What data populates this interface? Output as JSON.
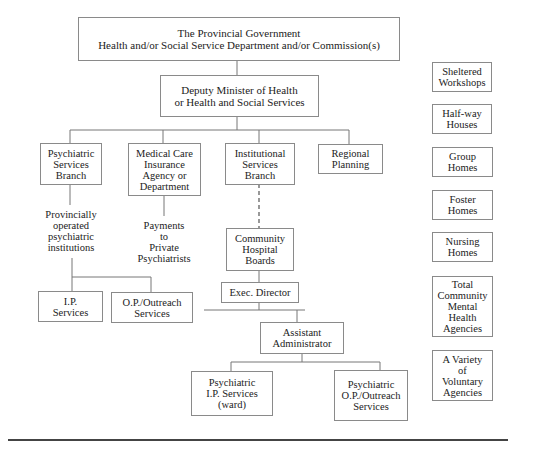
{
  "diagram": {
    "type": "organizational-chart",
    "nodes": {
      "provincial_government": "The Provincial Government\nHealth and/or Social Service Department and/or Commission(s)",
      "deputy_minister": "Deputy Minister of Health\nor Health and Social Services",
      "psychiatric_services_branch": "Psychiatric\nServices\nBranch",
      "medical_care_insurance": "Medical Care\nInsurance\nAgency or\nDepartment",
      "institutional_services_branch": "Institutional\nServices\nBranch",
      "regional_planning": "Regional\nPlanning",
      "provincially_operated": "Provincially\noperated\npsychiatric\ninstitutions",
      "payments_private": "Payments\nto\nPrivate\nPsychiatrists",
      "community_hospital_boards": "Community\nHospital\nBoards",
      "exec_director": "Exec. Director",
      "ip_services": "I.P.\nServices",
      "op_outreach_services": "O.P./Outreach\nServices",
      "assistant_administrator": "Assistant\nAdministrator",
      "psychiatric_ip_ward": "Psychiatric\nI.P. Services\n(ward)",
      "psychiatric_op_outreach": "Psychiatric\nO.P./Outreach\nServices"
    },
    "community_resources": [
      "Sheltered\nWorkshops",
      "Half-way\nHouses",
      "Group\nHomes",
      "Foster\nHomes",
      "Nursing\nHomes",
      "Total\nCommunity\nMental\nHealth\nAgencies",
      "A Variety\nof\nVoluntary\nAgencies"
    ],
    "edges": [
      {
        "from": "provincial_government",
        "to": "deputy_minister",
        "style": "solid"
      },
      {
        "from": "deputy_minister",
        "to": "psychiatric_services_branch",
        "style": "solid"
      },
      {
        "from": "deputy_minister",
        "to": "medical_care_insurance",
        "style": "solid"
      },
      {
        "from": "deputy_minister",
        "to": "institutional_services_branch",
        "style": "solid"
      },
      {
        "from": "deputy_minister",
        "to": "regional_planning",
        "style": "solid"
      },
      {
        "from": "psychiatric_services_branch",
        "to": "provincially_operated",
        "style": "solid"
      },
      {
        "from": "medical_care_insurance",
        "to": "payments_private",
        "style": "solid"
      },
      {
        "from": "institutional_services_branch",
        "to": "community_hospital_boards",
        "style": "dashed"
      },
      {
        "from": "provincially_operated",
        "to": "ip_services",
        "style": "solid"
      },
      {
        "from": "provincially_operated",
        "to": "op_outreach_services",
        "style": "solid"
      },
      {
        "from": "community_hospital_boards",
        "to": "exec_director",
        "style": "solid"
      },
      {
        "from": "exec_director",
        "to": "assistant_administrator",
        "style": "solid"
      },
      {
        "from": "assistant_administrator",
        "to": "psychiatric_ip_ward",
        "style": "solid"
      },
      {
        "from": "assistant_administrator",
        "to": "psychiatric_op_outreach",
        "style": "solid"
      }
    ]
  }
}
